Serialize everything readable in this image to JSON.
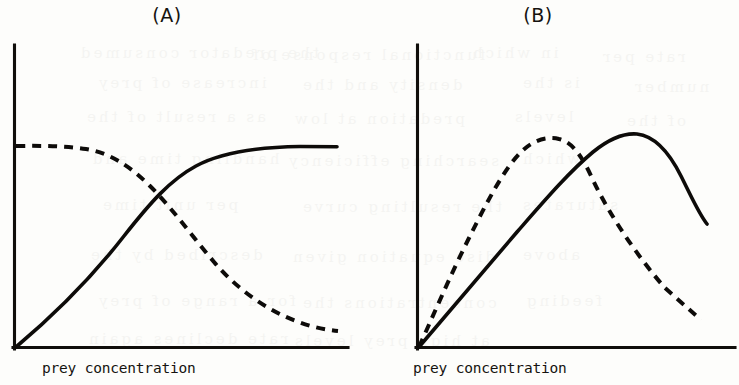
{
  "figure": {
    "panels": [
      {
        "id": "A",
        "label": "(A)",
        "xlabel": "prey concentration",
        "ylabel": ""
      },
      {
        "id": "B",
        "label": "(B)",
        "xlabel": "prey concentration",
        "ylabel": ""
      }
    ],
    "ink_color": "#0d0b09",
    "paper_color": "#fdfdfb"
  },
  "ghost_text": [
    {
      "text": "the predator consumed",
      "x": 78,
      "y": 44
    },
    {
      "text": "functional response of",
      "x": 250,
      "y": 46
    },
    {
      "text": "in which",
      "x": 470,
      "y": 44
    },
    {
      "text": "rate per",
      "x": 600,
      "y": 48
    },
    {
      "text": "increase of prey",
      "x": 96,
      "y": 74
    },
    {
      "text": "density and the",
      "x": 300,
      "y": 76
    },
    {
      "text": "is the",
      "x": 520,
      "y": 74
    },
    {
      "text": "number",
      "x": 632,
      "y": 78
    },
    {
      "text": "as a result of the",
      "x": 84,
      "y": 108
    },
    {
      "text": "predation at low",
      "x": 292,
      "y": 110
    },
    {
      "text": "levels",
      "x": 512,
      "y": 108
    },
    {
      "text": "of the",
      "x": 624,
      "y": 112
    },
    {
      "text": "handling time and",
      "x": 90,
      "y": 150
    },
    {
      "text": "searching efficiency",
      "x": 286,
      "y": 152
    },
    {
      "text": "which",
      "x": 520,
      "y": 150
    },
    {
      "text": "per unit time",
      "x": 100,
      "y": 196
    },
    {
      "text": "the resulting curve",
      "x": 300,
      "y": 198
    },
    {
      "text": "saturates",
      "x": 520,
      "y": 196
    },
    {
      "text": "described by the",
      "x": 88,
      "y": 246
    },
    {
      "text": "disc equation given",
      "x": 290,
      "y": 248
    },
    {
      "text": "above",
      "x": 520,
      "y": 246
    },
    {
      "text": "for a range of prey",
      "x": 96,
      "y": 292
    },
    {
      "text": "concentrations the",
      "x": 300,
      "y": 294
    },
    {
      "text": "feeding",
      "x": 524,
      "y": 292
    },
    {
      "text": "rate declines again",
      "x": 86,
      "y": 330
    },
    {
      "text": "at high prey levels",
      "x": 292,
      "y": 332
    }
  ],
  "chart_data": [
    {
      "type": "line",
      "title": "(A)",
      "xlabel": "prey concentration",
      "ylabel": "",
      "grid": false,
      "legend": false,
      "axis_ranges": {
        "x": [
          0,
          1
        ],
        "y": [
          0,
          1
        ]
      },
      "series": [
        {
          "name": "solid-curve",
          "style": "solid",
          "description": "saturating (Holling type II) feeding rate rising from origin to a plateau",
          "x": [
            0.0,
            0.06,
            0.12,
            0.19,
            0.26,
            0.33,
            0.4,
            0.47,
            0.52,
            0.58,
            0.64,
            0.71,
            0.78,
            0.86,
            0.93,
            1.0
          ],
          "y": [
            0.0,
            0.08,
            0.16,
            0.25,
            0.33,
            0.41,
            0.48,
            0.54,
            0.57,
            0.6,
            0.62,
            0.63,
            0.635,
            0.638,
            0.639,
            0.639
          ]
        },
        {
          "name": "dashed-curve",
          "style": "dashed",
          "description": "per-capita rate: flat at high value then declining steadily toward zero",
          "x": [
            0.0,
            0.08,
            0.15,
            0.21,
            0.27,
            0.33,
            0.4,
            0.47,
            0.55,
            0.63,
            0.71,
            0.8,
            0.88,
            0.95,
            1.0
          ],
          "y": [
            0.665,
            0.664,
            0.66,
            0.648,
            0.625,
            0.59,
            0.545,
            0.492,
            0.43,
            0.365,
            0.297,
            0.224,
            0.157,
            0.105,
            0.072
          ]
        }
      ]
    },
    {
      "type": "line",
      "title": "(B)",
      "xlabel": "prey concentration",
      "ylabel": "",
      "grid": false,
      "legend": false,
      "axis_ranges": {
        "x": [
          0,
          1
        ],
        "y": [
          0,
          1
        ]
      },
      "series": [
        {
          "name": "solid-curve",
          "style": "solid",
          "description": "dome-shaped response peaking late then falling",
          "x": [
            0.0,
            0.09,
            0.18,
            0.27,
            0.36,
            0.45,
            0.54,
            0.62,
            0.68,
            0.72,
            0.76,
            0.82,
            0.88,
            0.93,
            0.97
          ],
          "y": [
            0.0,
            0.085,
            0.17,
            0.255,
            0.34,
            0.425,
            0.51,
            0.58,
            0.628,
            0.648,
            0.65,
            0.626,
            0.566,
            0.492,
            0.428
          ]
        },
        {
          "name": "dashed-curve",
          "style": "dashed",
          "description": "dome-shaped response peaking early and higher-left, declining steeply",
          "x": [
            0.0,
            0.05,
            0.11,
            0.17,
            0.23,
            0.29,
            0.35,
            0.4,
            0.45,
            0.52,
            0.6,
            0.68,
            0.76,
            0.84,
            0.92,
            0.96
          ],
          "y": [
            0.0,
            0.115,
            0.255,
            0.38,
            0.49,
            0.575,
            0.62,
            0.635,
            0.63,
            0.588,
            0.515,
            0.432,
            0.345,
            0.258,
            0.175,
            0.132
          ]
        }
      ]
    }
  ]
}
